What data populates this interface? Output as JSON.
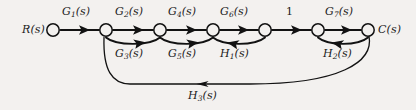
{
  "diagram": {
    "type": "signal-flow-graph",
    "background_color": "#f3f1ef",
    "ink_color": "#121212",
    "input_label": "R(s)",
    "output_label": "C(s)",
    "nodes": [
      {
        "id": "R",
        "label": "R(s)",
        "x": 53,
        "y": 30
      },
      {
        "id": "n2",
        "label": "",
        "x": 106,
        "y": 30
      },
      {
        "id": "n3",
        "label": "",
        "x": 160,
        "y": 30
      },
      {
        "id": "n4",
        "label": "",
        "x": 213,
        "y": 30
      },
      {
        "id": "n5",
        "label": "",
        "x": 265,
        "y": 30
      },
      {
        "id": "n6",
        "label": "",
        "x": 318,
        "y": 30
      },
      {
        "id": "C",
        "label": "C(s)",
        "x": 368,
        "y": 30
      }
    ],
    "branches": [
      {
        "id": "G1",
        "base": "G",
        "sub": "1",
        "arg": "(s)",
        "from": "R",
        "to": "n2",
        "shape": "straight",
        "side": "top",
        "label_x": 72,
        "label_y": 8
      },
      {
        "id": "G2",
        "base": "G",
        "sub": "2",
        "arg": "(s)",
        "from": "n2",
        "to": "n3",
        "shape": "straight",
        "side": "top",
        "label_x": 124,
        "label_y": 8
      },
      {
        "id": "G4",
        "base": "G",
        "sub": "4",
        "arg": "(s)",
        "from": "n3",
        "to": "n4",
        "shape": "straight",
        "side": "top",
        "label_x": 177,
        "label_y": 8
      },
      {
        "id": "G6",
        "base": "G",
        "sub": "6",
        "arg": "(s)",
        "from": "n4",
        "to": "n5",
        "shape": "straight",
        "side": "top",
        "label_x": 229,
        "label_y": 8
      },
      {
        "id": "U1",
        "base": "1",
        "sub": "",
        "arg": "",
        "from": "n5",
        "to": "n6",
        "shape": "straight",
        "side": "top",
        "label_x": 288,
        "label_y": 8
      },
      {
        "id": "G7",
        "base": "G",
        "sub": "7",
        "arg": "(s)",
        "from": "n6",
        "to": "C",
        "shape": "straight",
        "side": "top",
        "label_x": 334,
        "label_y": 8
      },
      {
        "id": "G3",
        "base": "G",
        "sub": "3",
        "arg": "(s)",
        "from": "n2",
        "to": "n3",
        "shape": "arc",
        "side": "bottom",
        "direction": "forward",
        "label_x": 118,
        "label_y": 48
      },
      {
        "id": "G5",
        "base": "G",
        "sub": "5",
        "arg": "(s)",
        "from": "n3",
        "to": "n4",
        "shape": "arc",
        "side": "bottom",
        "direction": "forward",
        "label_x": 171,
        "label_y": 48
      },
      {
        "id": "H1",
        "base": "H",
        "sub": "1",
        "arg": "(s)",
        "from": "n5",
        "to": "n4",
        "shape": "arc",
        "side": "bottom",
        "direction": "feedback",
        "label_x": 222,
        "label_y": 48
      },
      {
        "id": "H2",
        "base": "H",
        "sub": "2",
        "arg": "(s)",
        "from": "C",
        "to": "n6",
        "shape": "arc",
        "side": "bottom",
        "direction": "feedback",
        "label_x": 325,
        "label_y": 48
      },
      {
        "id": "H3",
        "base": "H",
        "sub": "3",
        "arg": "(s)",
        "from": "C",
        "to": "n2",
        "shape": "big-arc",
        "side": "bottom",
        "direction": "feedback",
        "label_x": 190,
        "label_y": 92
      }
    ]
  }
}
